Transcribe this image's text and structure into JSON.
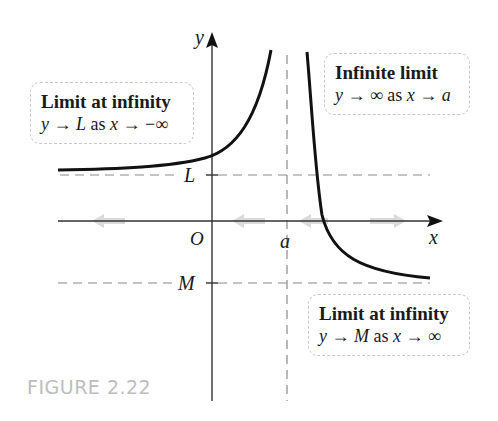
{
  "figure": {
    "label": "FIGURE 2.22",
    "label_color": "#bdbdbd"
  },
  "axes": {
    "x_label": "x",
    "y_label": "y",
    "origin_label": "O",
    "vertical_asymptote_label": "a",
    "horizontal_levels": [
      {
        "name": "L",
        "label": "L",
        "position": "above x-axis"
      },
      {
        "name": "M",
        "label": "M",
        "position": "below x-axis"
      }
    ]
  },
  "annotations": {
    "left": {
      "title": "Limit at infinity",
      "expr_parts": [
        "y",
        " → ",
        "L",
        " as ",
        "x",
        " → −∞"
      ]
    },
    "top_right": {
      "title": "Infinite limit",
      "expr_parts": [
        "y",
        " → ∞ as ",
        "x",
        " → ",
        "a"
      ]
    },
    "bottom_right": {
      "title": "Limit at infinity",
      "expr_parts": [
        "y",
        " → ",
        "M",
        " as ",
        "x",
        " → ∞"
      ]
    }
  },
  "colors": {
    "curve": "#111111",
    "axis": "#333333",
    "dashed": "#8a8a8a",
    "box_border": "#c8c8c8",
    "faded_arrows": "#d0d0d0"
  }
}
